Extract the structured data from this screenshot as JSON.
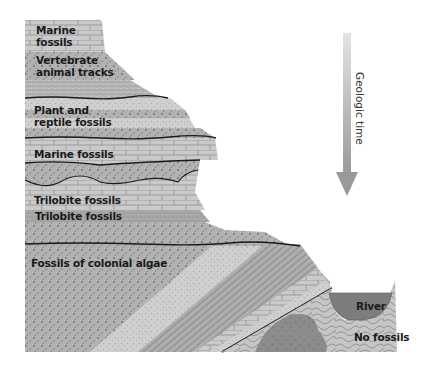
{
  "figure": {
    "type": "geologic cross-section",
    "time_arrow": {
      "label": "Geologic time",
      "direction": "down",
      "color": "#a0a0a0"
    },
    "layers": [
      {
        "id": "layer-1",
        "label_line1": "Marine",
        "label_line2": "fossils",
        "pattern": "brick"
      },
      {
        "id": "layer-2",
        "label_line1": "Vertebrate",
        "label_line2": "animal tracks",
        "pattern": "dotted"
      },
      {
        "id": "layer-3",
        "label_line1": "Plant and",
        "label_line2": "reptile fossils",
        "pattern": "banded"
      },
      {
        "id": "layer-4",
        "label": "Marine  fossils",
        "pattern": "brick"
      },
      {
        "id": "layer-5",
        "label": "Trilobite fossils",
        "pattern": "brick"
      },
      {
        "id": "layer-6",
        "label": "Trilobite fossils",
        "pattern": "hatched"
      },
      {
        "id": "layer-7",
        "label": "Fossils of colonial algae",
        "pattern": "dotted"
      }
    ],
    "basement": {
      "label": "No fossils",
      "pattern": "contorted"
    },
    "river": {
      "label": "River",
      "color": "#7a7a7a"
    },
    "colors": {
      "rock_light": "#c8c8c8",
      "rock_mid": "#b4b4b4",
      "rock_dark": "#9a9a9a",
      "river": "#7d7d7d",
      "unconformity": "#1a1a1a"
    }
  }
}
